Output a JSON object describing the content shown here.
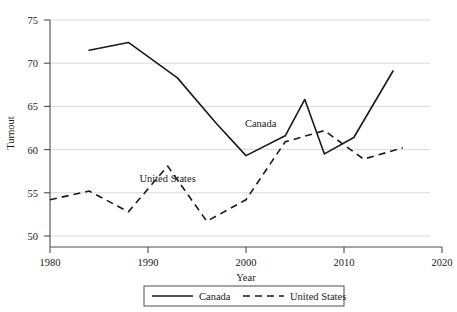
{
  "chart_data": {
    "type": "line",
    "title": "",
    "xlabel": "Year",
    "ylabel": "Turnout",
    "xlim": [
      1980,
      2020
    ],
    "ylim": [
      50,
      75
    ],
    "xticks": [
      "1980",
      "1990",
      "2000",
      "2010",
      "2020"
    ],
    "yticks": [
      "50",
      "55",
      "60",
      "65",
      "70",
      "75"
    ],
    "grid": true,
    "legend_position": "bottom-center",
    "series": [
      {
        "name": "Canada",
        "style": "solid",
        "color": "#1a1a1a",
        "annotation": "Canada",
        "x": [
          1984,
          1988,
          1993,
          1997,
          2000,
          2004,
          2006,
          2008,
          2011,
          2015
        ],
        "values": [
          71.5,
          72.4,
          68.3,
          63.0,
          59.3,
          61.6,
          65.8,
          59.5,
          61.4,
          69.1
        ]
      },
      {
        "name": "United States",
        "style": "dashed",
        "color": "#1a1a1a",
        "annotation": "United States",
        "x": [
          1980,
          1984,
          1988,
          1992,
          1996,
          2000,
          2004,
          2008,
          2012,
          2016
        ],
        "values": [
          54.2,
          55.2,
          52.8,
          58.1,
          51.7,
          54.2,
          60.9,
          62.2,
          58.9,
          60.2
        ]
      }
    ],
    "annotations": [
      {
        "text": "Canada",
        "x": 2001.5,
        "y": 62.6
      },
      {
        "text": "United States",
        "x": 1992.0,
        "y": 56.2
      }
    ],
    "legend": [
      {
        "label": "Canada",
        "style": "solid"
      },
      {
        "label": "United States",
        "style": "dashed"
      }
    ]
  }
}
